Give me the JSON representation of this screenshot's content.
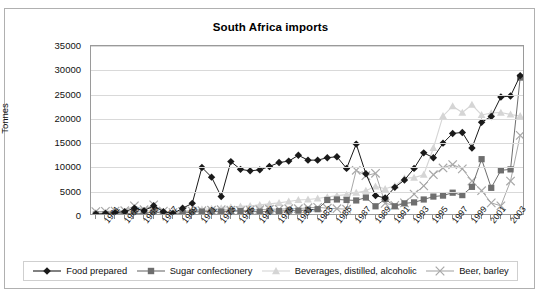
{
  "chart_data": {
    "type": "line",
    "title": "South Africa imports",
    "xlabel": "",
    "ylabel": "Tonnes",
    "ylim": [
      0,
      35000
    ],
    "ytick_values": [
      0,
      5000,
      10000,
      15000,
      20000,
      25000,
      30000,
      35000
    ],
    "ytick_labels": [
      "0",
      "5000",
      "10000",
      "15000",
      "20000",
      "25000",
      "30000",
      "35000"
    ],
    "grid": true,
    "legend_position": "bottom",
    "x": [
      1960,
      1961,
      1962,
      1963,
      1964,
      1965,
      1966,
      1967,
      1968,
      1969,
      1970,
      1971,
      1972,
      1973,
      1974,
      1975,
      1976,
      1977,
      1978,
      1979,
      1980,
      1981,
      1982,
      1983,
      1984,
      1985,
      1986,
      1987,
      1988,
      1989,
      1990,
      1991,
      1992,
      1993,
      1994,
      1995,
      1996,
      1997,
      1998,
      1999,
      2000,
      2001,
      2002,
      2003,
      2004
    ],
    "xtick_labels": [
      "1961",
      "1963",
      "1965",
      "1967",
      "1969",
      "1971",
      "1973",
      "1975",
      "1977",
      "1979",
      "1981",
      "1983",
      "1985",
      "1987",
      "1989",
      "1991",
      "1993",
      "1995",
      "1997",
      "1999",
      "2001",
      "2003"
    ],
    "series": [
      {
        "name": "Food prepared",
        "color": "#1a1a1a",
        "marker": "diamond",
        "values": [
          400,
          500,
          700,
          900,
          1600,
          1100,
          2100,
          900,
          500,
          1600,
          2600,
          10000,
          8000,
          4000,
          11200,
          9600,
          9300,
          9500,
          10200,
          11000,
          11300,
          12500,
          11500,
          11500,
          12000,
          12200,
          9800,
          14800,
          8700,
          4200,
          3700,
          5900,
          7400,
          9800,
          13000,
          12000,
          15000,
          17000,
          17200,
          14000,
          19300,
          20500,
          24500,
          24700,
          28900
        ]
      },
      {
        "name": "Sugar confectionery",
        "color": "#6e6e6e",
        "marker": "square",
        "values": [
          300,
          350,
          400,
          500,
          600,
          500,
          900,
          500,
          300,
          600,
          800,
          900,
          900,
          900,
          1000,
          1000,
          900,
          900,
          1000,
          1000,
          1100,
          1100,
          1300,
          1400,
          3300,
          3400,
          3300,
          3200,
          3800,
          2000,
          3500,
          2000,
          2600,
          2800,
          3400,
          4000,
          4200,
          4800,
          4300,
          6000,
          11700,
          5800,
          9400,
          9600,
          28500
        ]
      },
      {
        "name": "Beverages, distilled, alcoholic",
        "color": "#d5d5d5",
        "marker": "triangle",
        "values": [
          700,
          750,
          800,
          900,
          1000,
          950,
          1100,
          900,
          800,
          1000,
          1200,
          1400,
          1500,
          1600,
          1800,
          2000,
          2100,
          2300,
          2500,
          2700,
          3000,
          3300,
          3400,
          3600,
          3900,
          4200,
          4400,
          4800,
          5200,
          6100,
          5600,
          6200,
          7800,
          7900,
          8500,
          14000,
          20600,
          22600,
          21300,
          22900,
          20800,
          21200,
          21300,
          20900,
          20600
        ]
      },
      {
        "name": "Beer, barley",
        "color": "#a8a8a8",
        "marker": "cross",
        "values": [
          900,
          950,
          1000,
          1100,
          2100,
          1300,
          2300,
          1000,
          700,
          900,
          1000,
          1100,
          1200,
          1300,
          1200,
          1100,
          1200,
          1300,
          1400,
          1400,
          1500,
          1500,
          1700,
          1800,
          1600,
          1500,
          1400,
          9400,
          8300,
          8800,
          2600,
          2200,
          2700,
          4500,
          6200,
          8500,
          9900,
          10600,
          9700,
          7200,
          5200,
          2700,
          2100,
          7200,
          16600
        ]
      }
    ]
  },
  "legend": {
    "items": [
      {
        "label": "Food prepared"
      },
      {
        "label": "Sugar confectionery"
      },
      {
        "label": "Beverages, distilled, alcoholic"
      },
      {
        "label": "Beer, barley"
      }
    ]
  }
}
